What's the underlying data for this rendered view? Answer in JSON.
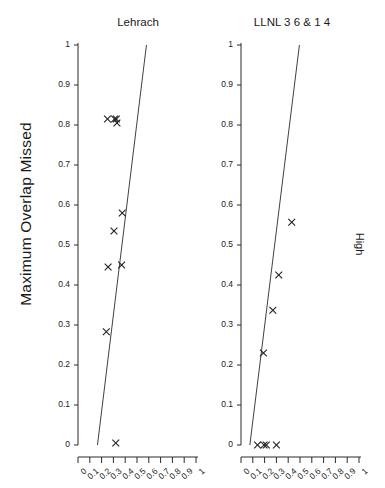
{
  "figure": {
    "ylabel": "Maximum Overlap Missed",
    "right_label": "High"
  },
  "panels": [
    {
      "title": "Lehrach"
    },
    {
      "title": "LLNL 3 6 & 1 4"
    }
  ],
  "axis": {
    "y_ticks": [
      "0",
      "0.1",
      "0.2",
      "0.3",
      "0.4",
      "0.5",
      "0.6",
      "0.7",
      "0.8",
      "0.9",
      "1"
    ],
    "x_ticks": [
      "0",
      "0.1",
      "0.2",
      "0.3",
      "0.4",
      "0.5",
      "0.6",
      "0.7",
      "0.8",
      "0.9",
      "1"
    ]
  },
  "chart_data": [
    {
      "type": "scatter",
      "title": "Lehrach",
      "xlabel": "",
      "ylabel": "Maximum Overlap Missed",
      "xlim": [
        0,
        1
      ],
      "ylim": [
        0,
        1
      ],
      "grid": false,
      "legend": null,
      "marker": "x",
      "marker_color": "#222222",
      "points": [
        {
          "x": 0.25,
          "y": 0.815
        },
        {
          "x": 0.31,
          "y": 0.815
        },
        {
          "x": 0.325,
          "y": 0.815
        },
        {
          "x": 0.33,
          "y": 0.805
        },
        {
          "x": 0.375,
          "y": 0.58
        },
        {
          "x": 0.305,
          "y": 0.535
        },
        {
          "x": 0.37,
          "y": 0.45
        },
        {
          "x": 0.255,
          "y": 0.445
        },
        {
          "x": 0.24,
          "y": 0.283
        },
        {
          "x": 0.32,
          "y": 0.005
        }
      ],
      "reference_line": {
        "x0": 0.165,
        "y0": 0.0,
        "x1": 0.58,
        "y1": 1.0
      }
    },
    {
      "type": "scatter",
      "title": "LLNL 3 6 & 1 4",
      "xlabel": "",
      "ylabel": "",
      "xlim": [
        0,
        1
      ],
      "ylim": [
        0,
        1
      ],
      "grid": false,
      "legend": null,
      "marker": "x",
      "marker_color": "#222222",
      "points": [
        {
          "x": 0.43,
          "y": 0.557
        },
        {
          "x": 0.32,
          "y": 0.425
        },
        {
          "x": 0.27,
          "y": 0.337
        },
        {
          "x": 0.19,
          "y": 0.23
        },
        {
          "x": 0.14,
          "y": 0.0
        },
        {
          "x": 0.195,
          "y": 0.0
        },
        {
          "x": 0.215,
          "y": 0.0
        },
        {
          "x": 0.3,
          "y": 0.0
        }
      ],
      "reference_line": {
        "x0": 0.075,
        "y0": 0.0,
        "x1": 0.495,
        "y1": 1.0
      }
    }
  ]
}
